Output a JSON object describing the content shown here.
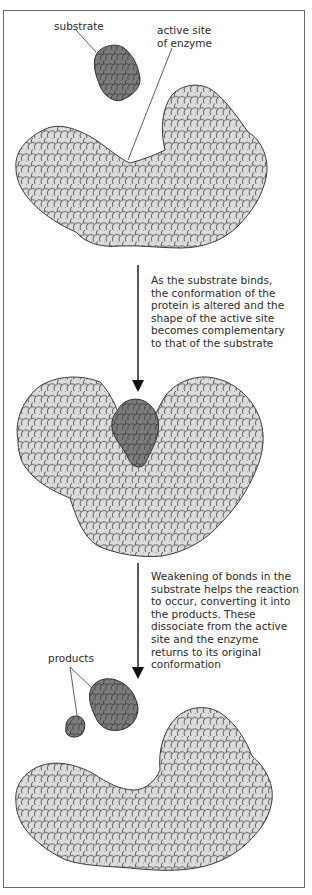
{
  "diagram": {
    "stages": [
      {
        "id": "unbound",
        "labels": {
          "substrate": "substrate",
          "active_site": [
            "active site",
            "of enzyme"
          ]
        }
      },
      {
        "id": "bound",
        "labels": {}
      },
      {
        "id": "released",
        "labels": {
          "products": "products"
        }
      }
    ],
    "transitions": [
      {
        "from": "unbound",
        "to": "bound",
        "caption_lines": [
          "As the substrate binds,",
          "the conformation of the",
          "protein is altered and the",
          "shape of the active site",
          "becomes complementary",
          "to that of the substrate"
        ]
      },
      {
        "from": "bound",
        "to": "released",
        "caption_lines": [
          "Weakening of bonds in the",
          "substrate helps the reaction",
          "to occur, converting it into",
          "the products. These",
          "dissociate from the active",
          "site and the enzyme",
          "returns to its original",
          "conformation"
        ]
      }
    ],
    "colors": {
      "enzyme_atom_fill": "#dcdcdc",
      "substrate_atom_fill": "#7a7a7a",
      "atom_stroke": "#333333",
      "frame_border": "#6a6a6a",
      "arrow": "#111111",
      "text": "#2a2a2a"
    }
  }
}
